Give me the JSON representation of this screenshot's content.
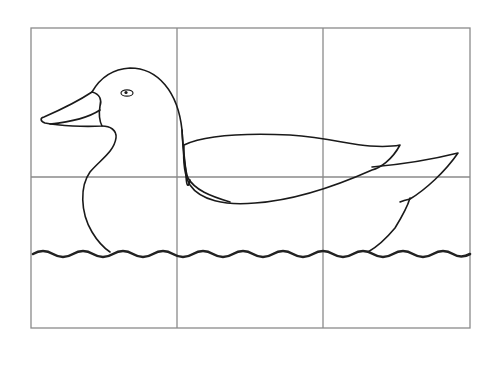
{
  "figure": {
    "grid": {
      "rows": 3,
      "columns": 3,
      "line_color": "#8a8a8a"
    },
    "outline_color": "#1a1a1a",
    "water_color": "#222222",
    "parts": [
      "head",
      "eye",
      "bill",
      "neck",
      "body",
      "wing",
      "tail",
      "water-line"
    ]
  }
}
